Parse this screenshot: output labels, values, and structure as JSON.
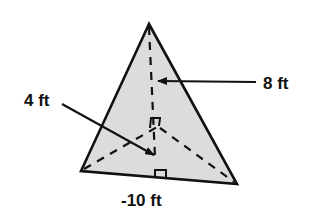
{
  "figure": {
    "type": "pyramid-triangular-base",
    "fill_color": "#dcdcdc",
    "stroke_color": "#111111",
    "labels": {
      "slant_height": "8 ft",
      "apothem": "4 ft",
      "base_edge": "-10 ft"
    }
  }
}
